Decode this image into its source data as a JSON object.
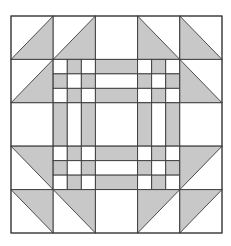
{
  "diagram": {
    "type": "quilt-block",
    "grid": 5,
    "origin": [
      11,
      16
    ],
    "size": [
      211,
      217
    ],
    "colors": {
      "fabric_dark": "#c8c8c8",
      "fabric_light": "#ffffff",
      "seam": "#3a3a3a"
    },
    "cells": [
      [
        "hst-br",
        "hst-br",
        "plain",
        "hst-bl",
        "hst-bl"
      ],
      [
        "hst-br",
        "ninepatch",
        "stripes-h",
        "ninepatch",
        "hst-bl"
      ],
      [
        "plain",
        "stripes-v",
        "plain",
        "stripes-v",
        "plain"
      ],
      [
        "hst-tr",
        "ninepatch",
        "stripes-h",
        "ninepatch",
        "hst-tl"
      ],
      [
        "hst-tr",
        "hst-tr",
        "plain",
        "hst-tl",
        "hst-tl"
      ]
    ]
  }
}
